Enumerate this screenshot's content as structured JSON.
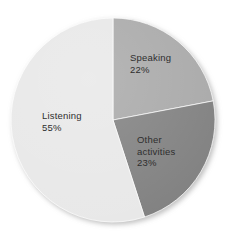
{
  "chart_data": {
    "type": "pie",
    "title": "",
    "subtitle": "",
    "xlabel": "",
    "ylabel": "",
    "legend_position": "none",
    "grid": false,
    "labels_inside_slices": true,
    "start_angle_deg": 0,
    "direction": "clockwise",
    "categories": [
      "Speaking",
      "Other activities",
      "Listening"
    ],
    "values": [
      22,
      23,
      55
    ],
    "unit": "%",
    "slices": [
      {
        "name": "Speaking",
        "label_line1": "Speaking",
        "label_line2": "",
        "value": 22,
        "value_text": "22%",
        "color": "#a9a9a9",
        "start_pct": 0,
        "end_pct": 22
      },
      {
        "name": "Other activities",
        "label_line1": "Other",
        "label_line2": "activities",
        "value": 23,
        "value_text": "23%",
        "color": "#818181",
        "start_pct": 22,
        "end_pct": 45
      },
      {
        "name": "Listening",
        "label_line1": "Listening",
        "label_line2": "",
        "value": 55,
        "value_text": "55%",
        "color": "#e8e8e8",
        "start_pct": 45,
        "end_pct": 100
      }
    ]
  },
  "style": {
    "background": "#ffffff",
    "label_text_color": "#2e2e2e",
    "slice_edge_color": "#ffffff",
    "shadow_color": "#c8c8c8"
  },
  "geometry": {
    "center_x": 113,
    "center_y": 120,
    "radius": 102
  }
}
